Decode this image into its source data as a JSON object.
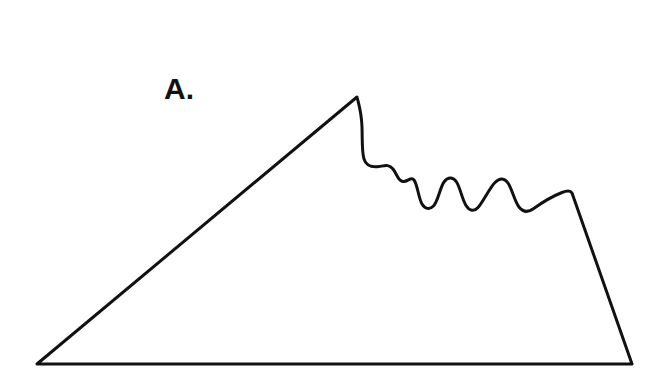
{
  "figure": {
    "panel_label": "A.",
    "background_color": "#ffffff",
    "stroke_color": "#111111",
    "stroke_width": 3,
    "fill_color": "none",
    "width": 661,
    "height": 374,
    "shape_path": "M 37 364 L 357 97 C 358.5 103 361.5 112 362 127 C 362.4 140 361.8 152 364 159 C 366.5 166.5 372 167.5 379 166.5 C 385 165.6 389 164 393 169 C 397 174 398 181 403 181.5 C 408 182 411 176 414 180 C 417.5 184.5 418.5 198 422 204 C 425 209 429.5 210 433.5 206 C 438 201.5 440 187.5 444 182 C 448 176.5 453 177 456.5 182 C 460 187 462 199 466 205.5 C 469.5 211 474 212 478 207.5 C 483 202 489.5 188 495 182.5 C 500 177.5 504.5 178 508 183 C 512 189 515 202 519 207 C 523 212 528 212.5 533 209 C 540 204 553 196 562 192.5 C 567 190.5 570.5 190.5 572 193 L 632 364 Z",
    "vertices": {
      "bottom_left": [
        37,
        364
      ],
      "apex": [
        357,
        97
      ],
      "right_shoulder": [
        572,
        193
      ],
      "bottom_right": [
        632,
        364
      ]
    },
    "wave_peaks": [
      [
        403,
        181
      ],
      [
        444,
        182
      ],
      [
        495,
        182
      ],
      [
        546,
        200
      ]
    ],
    "wave_valleys": [
      [
        422,
        204
      ],
      [
        466,
        205
      ],
      [
        519,
        207
      ]
    ]
  }
}
